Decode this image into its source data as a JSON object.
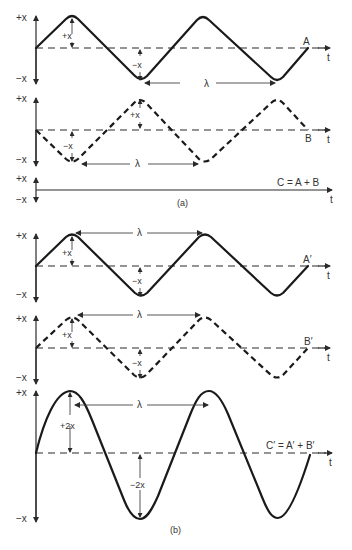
{
  "figure": {
    "panel_a": {
      "caption": "(a)",
      "wave_a": {
        "label": "A",
        "style": "solid"
      },
      "wave_b": {
        "label": "B",
        "style": "dashed"
      },
      "sum": {
        "label": "C = A + B"
      },
      "amp_plus": "+x",
      "amp_minus": "−x",
      "wavelength": "λ"
    },
    "panel_b": {
      "caption": "(b)",
      "wave_a": {
        "label": "A′",
        "style": "solid"
      },
      "wave_b": {
        "label": "B′",
        "style": "dashed"
      },
      "sum": {
        "label": "C′ = A′ + B′"
      },
      "amp_plus": "+x",
      "amp_minus": "−x",
      "sum_plus": "+2x",
      "sum_minus": "−2x",
      "wavelength": "λ"
    },
    "axis": {
      "top": "+x",
      "bottom": "−x",
      "time": "t"
    }
  }
}
